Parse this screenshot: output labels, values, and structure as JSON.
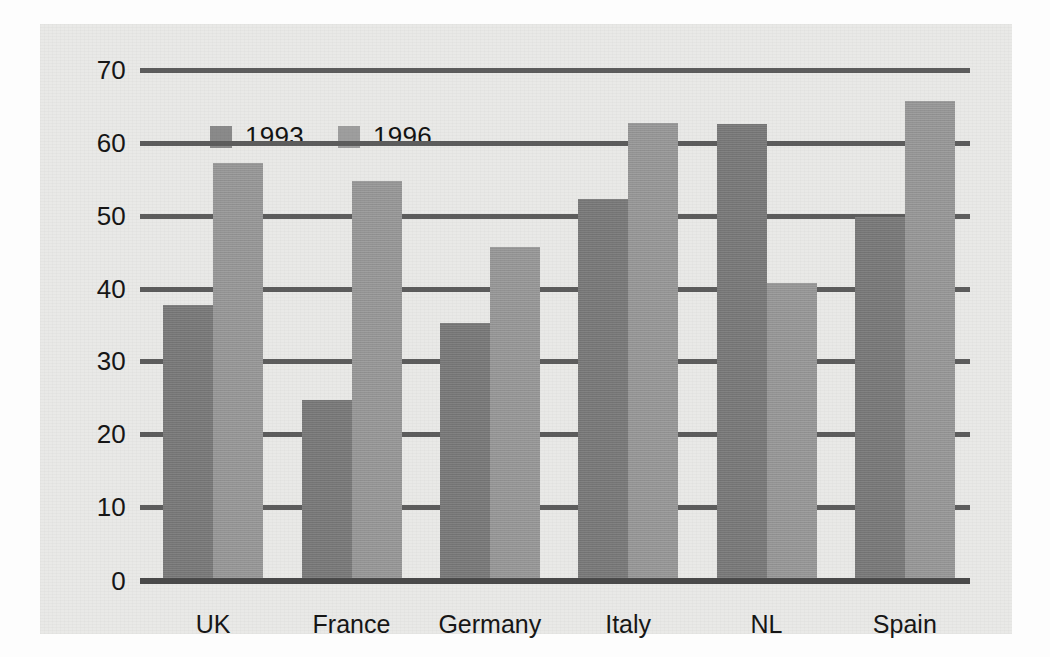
{
  "chart_data": {
    "type": "bar",
    "title": "",
    "subtitle": "",
    "xlabel": "",
    "ylabel": "",
    "categories": [
      "UK",
      "France",
      "Germany",
      "Italy",
      "NL",
      "Spain"
    ],
    "series": [
      {
        "name": "1993",
        "color": "#7b7b7b",
        "values": [
          37.5,
          24.5,
          35.0,
          52.0,
          62.3,
          49.5
        ]
      },
      {
        "name": "1996",
        "color": "#9a9a9a",
        "values": [
          57.0,
          54.5,
          45.5,
          62.5,
          40.5,
          65.5
        ]
      }
    ],
    "ylim": [
      0,
      70
    ],
    "yticks": [
      0,
      10,
      20,
      30,
      40,
      50,
      60,
      70
    ],
    "ytick_labels": [
      "0",
      "10",
      "20",
      "30",
      "40",
      "50",
      "60",
      "70"
    ],
    "grid": true,
    "grid_axis": "y",
    "legend": {
      "position": "top-left-inside",
      "entries": [
        {
          "label": "1993",
          "swatch_color": "#8a8a8a"
        },
        {
          "label": "1996",
          "swatch_color": "#9e9e9e"
        }
      ]
    },
    "annotations": []
  },
  "figure": {
    "background_color": "#e9e9e7",
    "page_color": "#fdfdfd",
    "axis_color": "#5d5d5d",
    "text_color": "#161616"
  }
}
